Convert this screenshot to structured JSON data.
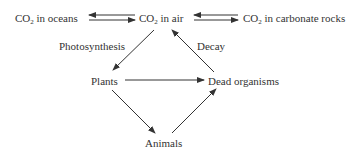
{
  "diagram": {
    "nodes": {
      "co2_oceans": {
        "pre": "CO",
        "sub": "2",
        "post": " in oceans"
      },
      "co2_air": {
        "pre": "CO",
        "sub": "2",
        "post": " in air"
      },
      "co2_rocks": {
        "pre": "CO",
        "sub": "2",
        "post": " in carbonate rocks"
      },
      "plants": "Plants",
      "dead": "Dead organisms",
      "animals": "Animals"
    },
    "edge_labels": {
      "photosynthesis": "Photosynthesis",
      "decay": "Decay"
    },
    "edges": [
      {
        "from": "CO2 in air",
        "to": "CO2 in oceans"
      },
      {
        "from": "CO2 in oceans",
        "to": "CO2 in air"
      },
      {
        "from": "CO2 in carbonate rocks",
        "to": "CO2 in air"
      },
      {
        "from": "CO2 in air",
        "to": "CO2 in carbonate rocks"
      },
      {
        "from": "CO2 in air",
        "to": "Plants",
        "label": "Photosynthesis"
      },
      {
        "from": "Dead organisms",
        "to": "CO2 in air",
        "label": "Decay"
      },
      {
        "from": "Plants",
        "to": "Dead organisms"
      },
      {
        "from": "Plants",
        "to": "Animals"
      },
      {
        "from": "Animals",
        "to": "Dead organisms"
      }
    ]
  }
}
